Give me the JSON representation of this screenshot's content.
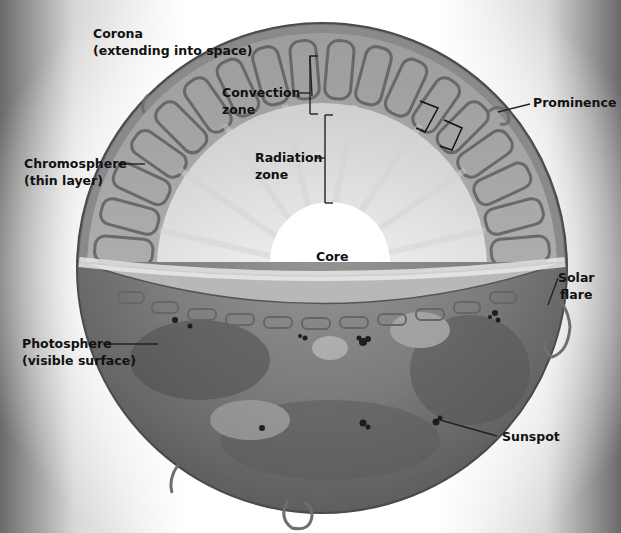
{
  "diagram": {
    "colors": {
      "surface": "#7a7a7a",
      "convection_cells": "#8c8c8c",
      "radiation_zone": "#e6e6e6",
      "core": "#ffffff",
      "label_text": "#111111",
      "leader_line": "#222222"
    },
    "labels": {
      "corona": {
        "line1": "Corona",
        "line2": "(extending into space)"
      },
      "convection_zone": {
        "line1": "Convection",
        "line2": "zone"
      },
      "radiation_zone": {
        "line1": "Radiation",
        "line2": "zone"
      },
      "prominence": {
        "line1": "Prominence"
      },
      "chromosphere": {
        "line1": "Chromosphere",
        "line2": "(thin layer)"
      },
      "core": {
        "line1": "Core"
      },
      "solar_flare": {
        "line1": "Solar",
        "line2": "flare"
      },
      "photosphere": {
        "line1": "Photosphere",
        "line2": "(visible surface)"
      },
      "sunspot": {
        "line1": "Sunspot"
      }
    }
  }
}
